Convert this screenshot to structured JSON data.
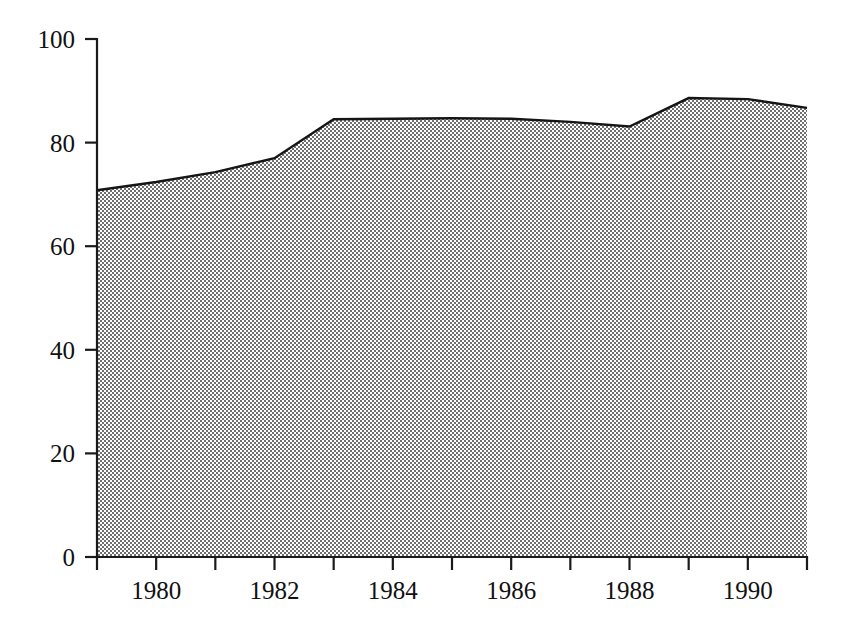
{
  "chart_data": {
    "type": "area",
    "title": "",
    "subtitle": "",
    "xlabel": "",
    "ylabel": "",
    "x": [
      1979,
      1980,
      1981,
      1982,
      1983,
      1984,
      1985,
      1986,
      1987,
      1988,
      1989,
      1990,
      1991
    ],
    "values": [
      70.8,
      72.4,
      74.3,
      77.0,
      84.5,
      84.6,
      84.7,
      84.6,
      84.0,
      83.1,
      88.6,
      88.4,
      86.7
    ],
    "series": [
      {
        "name": "series-1",
        "values": [
          70.8,
          72.4,
          74.3,
          77.0,
          84.5,
          84.6,
          84.7,
          84.6,
          84.0,
          83.1,
          88.6,
          88.4,
          86.7
        ]
      }
    ],
    "xlim": [
      1979,
      1991
    ],
    "ylim": [
      0,
      100
    ],
    "yticks": [
      0,
      20,
      40,
      60,
      80,
      100
    ],
    "ytick_labels": [
      "0",
      "20",
      "40",
      "60",
      "80",
      "100"
    ],
    "xticks": [
      1979,
      1980,
      1981,
      1982,
      1983,
      1984,
      1985,
      1986,
      1987,
      1988,
      1989,
      1990,
      1991
    ],
    "xtick_labels": [
      "",
      "1980",
      "",
      "1982",
      "",
      "1984",
      "",
      "1986",
      "",
      "1988",
      "",
      "1990",
      ""
    ],
    "grid": false,
    "legend": null,
    "legend_position": "none",
    "annotations": [],
    "colors": {
      "area_fill": "#808080",
      "line": "#151515",
      "axis": "#1a1a1a",
      "text": "#111111",
      "background": "#ffffff"
    },
    "fill_style": "checkerboard-dither-50"
  },
  "axes": {
    "y_axis_name": "y-axis",
    "x_axis_name": "x-axis"
  }
}
